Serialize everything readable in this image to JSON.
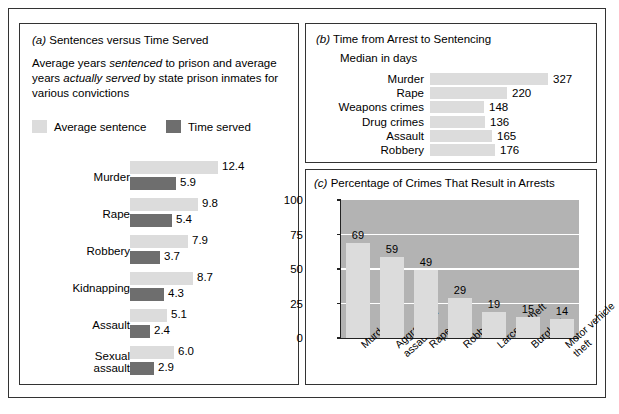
{
  "figure": {
    "panel_a": {
      "tag": "(a)",
      "title": "Sentences versus Time Served",
      "subtitle_1": "Average years ",
      "subtitle_em1": "sentenced",
      "subtitle_2": " to prison and average",
      "subtitle_3": "years ",
      "subtitle_em2": "actually served",
      "subtitle_4": " by state prison inmates",
      "subtitle_5": "for various convictions",
      "legend": [
        {
          "label": "Average sentence",
          "color": "#dcdcdc"
        },
        {
          "label": "Time served",
          "color": "#6e6e6e"
        }
      ]
    },
    "panel_b": {
      "tag": "(b)",
      "title": "Time from Arrest to Sentencing",
      "subtitle": "Median in days"
    },
    "panel_c": {
      "tag": "(c)",
      "title": "Percentage of Crimes That Result in Arrests"
    }
  },
  "chart_data": [
    {
      "type": "bar",
      "orientation": "horizontal",
      "panel": "a",
      "title": "Sentences versus Time Served",
      "subtitle": "Average years sentenced to prison and average years actually served by state prison inmates for various convictions",
      "xlabel": "",
      "ylabel": "",
      "grid": false,
      "legend_position": "top",
      "categories": [
        "Murder",
        "Rape",
        "Robbery",
        "Kidnapping",
        "Assault",
        "Sexual assault"
      ],
      "category_lines": [
        [
          "Murder"
        ],
        [
          "Rape"
        ],
        [
          "Robbery"
        ],
        [
          "Kidnapping"
        ],
        [
          "Assault"
        ],
        [
          "Sexual",
          "assault"
        ]
      ],
      "series": [
        {
          "name": "Average sentence",
          "color": "#dcdcdc",
          "values": [
            12.4,
            9.8,
            7.9,
            8.7,
            5.1,
            6.0
          ],
          "labels": [
            "12.4",
            "9.8",
            "7.9",
            "8.7",
            "5.1",
            "6.0"
          ],
          "bar_px": [
            88,
            68,
            58,
            63,
            37,
            44
          ]
        },
        {
          "name": "Time served",
          "color": "#6e6e6e",
          "values": [
            5.9,
            5.4,
            3.7,
            4.3,
            2.4,
            2.9
          ],
          "labels": [
            "5.9",
            "5.4",
            "3.7",
            "4.3",
            "2.4",
            "2.9"
          ],
          "bar_px": [
            46,
            42,
            30,
            34,
            20,
            24
          ]
        }
      ]
    },
    {
      "type": "bar",
      "orientation": "horizontal",
      "panel": "b",
      "title": "Time from Arrest to Sentencing",
      "subtitle": "Median in days",
      "xlabel": "",
      "ylabel": "",
      "grid": false,
      "legend_position": "none",
      "categories": [
        "Murder",
        "Rape",
        "Weapons crimes",
        "Drug crimes",
        "Assault",
        "Robbery"
      ],
      "values": [
        327,
        220,
        148,
        136,
        165,
        176
      ],
      "labels": [
        "327",
        "220",
        "148",
        "136",
        "165",
        "176"
      ],
      "bar_px": [
        118,
        77,
        54,
        55,
        62,
        65
      ],
      "color": "#dcdcdc"
    },
    {
      "type": "bar",
      "orientation": "vertical",
      "panel": "c",
      "title": "Percentage of Crimes That Result in Arrests",
      "xlabel": "",
      "ylabel": "",
      "ylim": [
        0,
        100
      ],
      "yticks": [
        0,
        25,
        50,
        75,
        100
      ],
      "ytick_labels": [
        "0",
        "25",
        "50",
        "75",
        "100"
      ],
      "grid": true,
      "legend_position": "none",
      "plot_background": "#b3b3b3",
      "bar_color": "#dcdcdc",
      "gridline_color": "#ffffff",
      "categories": [
        "Murder",
        "Aggravated assault",
        "Rape",
        "Robbery",
        "Larceny-theft",
        "Burglary",
        "Motor vehicle theft"
      ],
      "category_lines": [
        [
          "Murder"
        ],
        [
          "Aggravated",
          "assault"
        ],
        [
          "Rape"
        ],
        [
          "Robbery"
        ],
        [
          "Larceny-theft"
        ],
        [
          "Burglary"
        ],
        [
          "Motor vehicle",
          "theft"
        ]
      ],
      "values": [
        69,
        59,
        49,
        29,
        19,
        15,
        14
      ],
      "labels": [
        "69",
        "59",
        "49",
        "29",
        "19",
        "15",
        "14"
      ]
    }
  ]
}
